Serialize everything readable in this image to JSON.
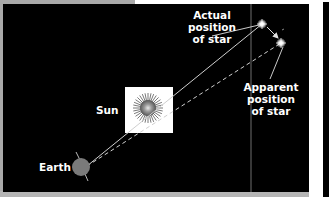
{
  "diagram": {
    "title": "",
    "labels": {
      "actual_line1": "Actual",
      "actual_line2": "position",
      "actual_line3": "of star",
      "apparent_line1": "Apparent",
      "apparent_line2": "position",
      "apparent_line3": "of star",
      "sun": "Sun",
      "earth": "Earth"
    },
    "colors": {
      "background": "#000000",
      "frame_gray": "#a9a9a9",
      "earth": "#7a7a7a",
      "sun_box": "#ffffff",
      "lines": "#d9d9d9",
      "text": "#ffffff"
    },
    "elements": [
      {
        "name": "Earth",
        "type": "planet"
      },
      {
        "name": "Sun",
        "type": "star"
      },
      {
        "name": "Actual position of star",
        "type": "star-marker"
      },
      {
        "name": "Apparent position of star",
        "type": "star-marker"
      }
    ]
  }
}
